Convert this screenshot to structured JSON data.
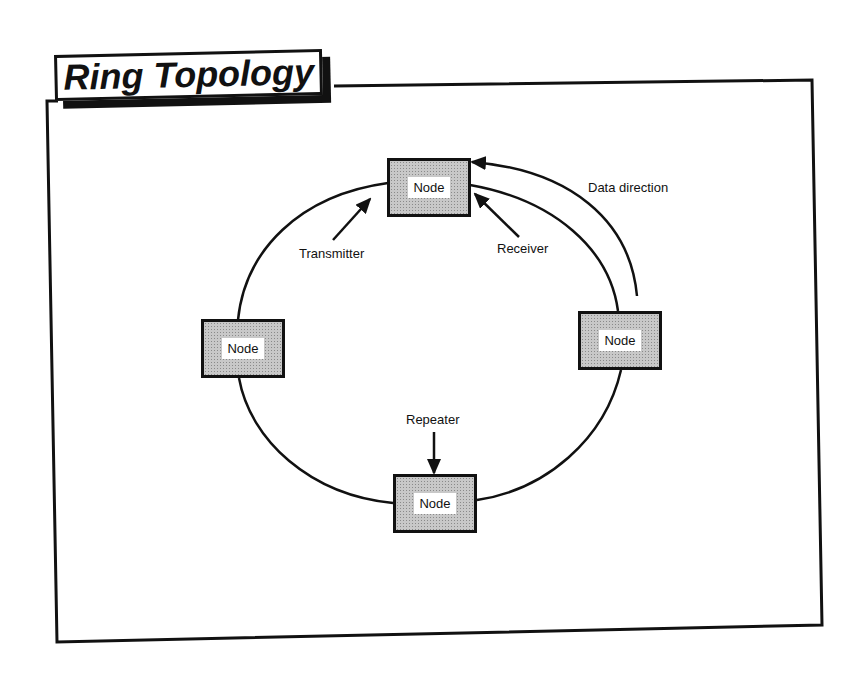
{
  "title": "Ring Topology",
  "colors": {
    "ink": "#111111",
    "node_fill": "#c8c8c8",
    "background": "#ffffff"
  },
  "nodes": [
    {
      "id": "top",
      "label": "Node"
    },
    {
      "id": "left",
      "label": "Node"
    },
    {
      "id": "right",
      "label": "Node"
    },
    {
      "id": "bottom",
      "label": "Node"
    }
  ],
  "annotations": {
    "transmitter": "Transmitter",
    "receiver": "Receiver",
    "data_direction": "Data direction",
    "repeater": "Repeater"
  }
}
